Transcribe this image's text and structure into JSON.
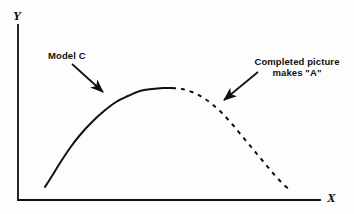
{
  "figure": {
    "background_color": "#fdfdfd",
    "ink_color": "#101010",
    "width": 354,
    "height": 214
  },
  "axes": {
    "y_label": "Y",
    "x_label": "X",
    "origin": {
      "x": 18,
      "y": 200
    },
    "y_axis_top": {
      "x": 18,
      "y": 25
    },
    "x_axis_right": {
      "x": 320,
      "y": 200
    },
    "line_width": 1.8,
    "grid": false,
    "ticks": []
  },
  "annotations": [
    {
      "id": "model-c",
      "text": "Model C",
      "lines": [
        "Model C"
      ],
      "x": 48,
      "y": 50,
      "align": "left",
      "arrow": {
        "from": {
          "x": 72,
          "y": 64
        },
        "to": {
          "x": 103,
          "y": 92
        },
        "direction": "down-right"
      }
    },
    {
      "id": "completed-picture",
      "text": "Completed picture makes \"A\"",
      "lines": [
        "Completed picture",
        "makes \"A\""
      ],
      "x": 244,
      "y": 56,
      "align": "center",
      "arrow": {
        "from": {
          "x": 258,
          "y": 72
        },
        "to": {
          "x": 224,
          "y": 100
        },
        "direction": "down-left"
      }
    }
  ],
  "chart_data": {
    "type": "line",
    "title": "",
    "subtitle": "",
    "xlabel": "X",
    "ylabel": "Y",
    "xlim": [
      0,
      1
    ],
    "ylim": [
      0,
      1
    ],
    "grid": false,
    "legend": null,
    "annotations": [
      "Model C",
      "Completed picture makes \"A\""
    ],
    "series": [
      {
        "name": "Model C (observed)",
        "style": "solid",
        "color": "#101010",
        "points": [
          [
            45,
            187
          ],
          [
            52,
            176
          ],
          [
            60,
            163
          ],
          [
            70,
            148
          ],
          [
            80,
            135
          ],
          [
            92,
            122
          ],
          [
            104,
            111
          ],
          [
            116,
            102
          ],
          [
            128,
            96
          ],
          [
            140,
            91
          ],
          [
            152,
            89
          ],
          [
            163,
            88
          ],
          [
            172,
            88
          ]
        ]
      },
      {
        "name": "Completed picture (extrapolated)",
        "style": "dashed",
        "color": "#101010",
        "dash_pattern": "4 5",
        "points": [
          [
            172,
            88
          ],
          [
            182,
            89
          ],
          [
            192,
            92
          ],
          [
            202,
            97
          ],
          [
            212,
            104
          ],
          [
            222,
            113
          ],
          [
            232,
            124
          ],
          [
            242,
            136
          ],
          [
            252,
            148
          ],
          [
            262,
            160
          ],
          [
            272,
            172
          ],
          [
            282,
            183
          ],
          [
            290,
            190
          ]
        ]
      }
    ],
    "peak": {
      "x": 168,
      "y": 88
    }
  }
}
